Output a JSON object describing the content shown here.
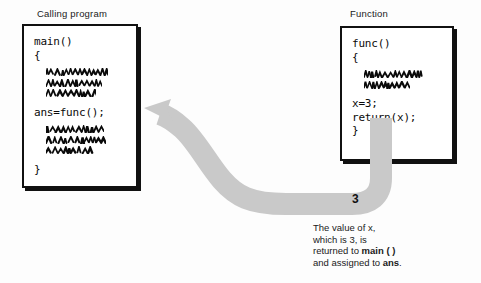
{
  "diagram": {
    "title_left": "Calling program",
    "title_right": "Function",
    "arrow_value_label": "3",
    "arrow_color": "#c9c9c9",
    "box_border_color": "#111111",
    "text_color": "#1a1a1a"
  },
  "calling_program_box": {
    "caption": "Calling program",
    "lines": [
      {
        "type": "code",
        "text": "main()"
      },
      {
        "type": "code",
        "text": "{"
      },
      {
        "type": "spacer",
        "text": ""
      },
      {
        "type": "squiggle",
        "text": "",
        "width": 62
      },
      {
        "type": "squiggle",
        "text": "",
        "width": 56
      },
      {
        "type": "squiggle",
        "text": "",
        "width": 50
      },
      {
        "type": "spacer",
        "text": ""
      },
      {
        "type": "code",
        "text": "ans=func();"
      },
      {
        "type": "spacer",
        "text": ""
      },
      {
        "type": "squiggle",
        "text": "",
        "width": 58
      },
      {
        "type": "squiggle",
        "text": "",
        "width": 60
      },
      {
        "type": "squiggle",
        "text": "",
        "width": 48
      },
      {
        "type": "spacer",
        "text": ""
      },
      {
        "type": "code",
        "text": "}"
      }
    ]
  },
  "function_box": {
    "caption": "Function",
    "lines": [
      {
        "type": "code",
        "text": "func()"
      },
      {
        "type": "code",
        "text": "{"
      },
      {
        "type": "spacer",
        "text": ""
      },
      {
        "type": "squiggle",
        "text": "",
        "width": 60
      },
      {
        "type": "squiggle",
        "text": "",
        "width": 46
      },
      {
        "type": "spacer",
        "text": ""
      },
      {
        "type": "code",
        "text": "x=3;"
      },
      {
        "type": "code",
        "text": "return(x);"
      },
      {
        "type": "code",
        "text": "}"
      }
    ]
  },
  "explanation": {
    "line1": "The value of x,",
    "line2": "which is 3, is",
    "line3_prefix": "returned to ",
    "line3_bold": "main ( )",
    "line4_prefix": "and assigned to ",
    "line4_bold": "ans",
    "line4_suffix": "."
  }
}
